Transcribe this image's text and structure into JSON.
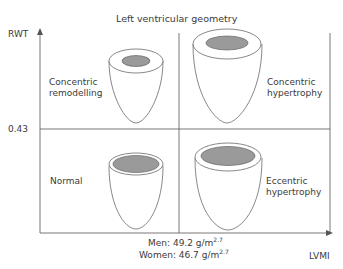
{
  "title": "Left ventricular geometry",
  "axes": {
    "y_label": "RWT",
    "y_threshold": "0.43",
    "x_label": "LVMI",
    "x_threshold_men": "Men: 49.2 g/m",
    "x_threshold_women": "Women: 46.7 g/m",
    "exponent": "2.7"
  },
  "quadrants": {
    "top_left": {
      "line1": "Concentric",
      "line2": "remodelling"
    },
    "top_right": {
      "line1": "Concentric",
      "line2": "hypertrophy"
    },
    "bottom_left": {
      "line1": "Normal",
      "line2": ""
    },
    "bottom_right": {
      "line1": "Eccentric",
      "line2": "hypertrophy"
    }
  },
  "colors": {
    "line": "#555555",
    "cavity": "#9a9a9a",
    "text": "#3a3a3a"
  }
}
